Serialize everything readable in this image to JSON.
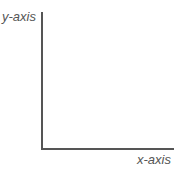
{
  "chart_data": {
    "type": "line",
    "title": "",
    "xlabel": "x-axis",
    "ylabel": "y-axis",
    "series": [],
    "grid": false,
    "legend": null
  },
  "colors": {
    "axis": "#555555",
    "label": "#555555",
    "background": "#ffffff"
  }
}
